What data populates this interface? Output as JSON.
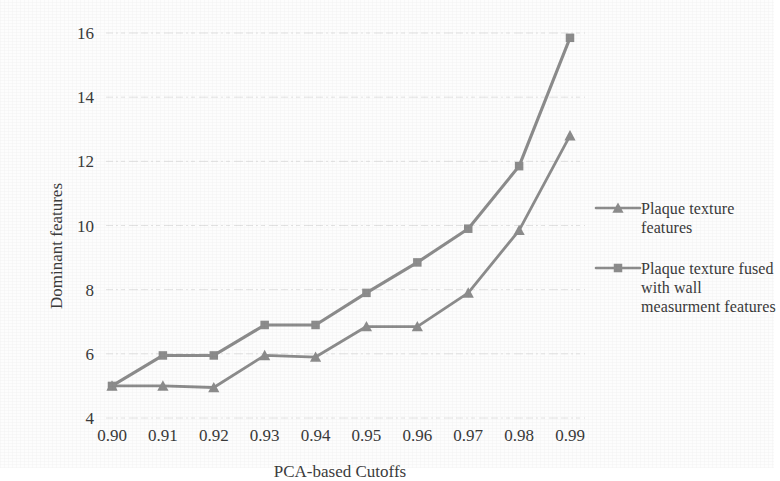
{
  "chart_data": {
    "type": "line",
    "title": "",
    "xlabel": "PCA-based Cutoffs",
    "ylabel": "Dominant features",
    "categories": [
      "0.90",
      "0.91",
      "0.92",
      "0.93",
      "0.94",
      "0.95",
      "0.96",
      "0.97",
      "0.98",
      "0.99"
    ],
    "x_tick_labels": [
      "0.90",
      "0.91",
      "0.92",
      "0.93",
      "0.94",
      "0.95",
      "0.96",
      "0.97",
      "0.98",
      "0.99"
    ],
    "y_tick_labels": [
      "4",
      "6",
      "8",
      "10",
      "12",
      "14",
      "16"
    ],
    "y_ticks": [
      4,
      6,
      8,
      10,
      12,
      14,
      16
    ],
    "ylim": [
      3.6,
      16.3
    ],
    "grid": "horizontal-dotted",
    "legend_position": "right",
    "series": [
      {
        "name": "Plaque texture features",
        "marker": "triangle",
        "color": "#8c8c8c",
        "values": [
          5.0,
          5.0,
          4.95,
          5.95,
          5.9,
          6.85,
          6.85,
          7.9,
          9.85,
          12.8
        ]
      },
      {
        "name": "Plaque texture fused with wall measurment features",
        "marker": "square",
        "color": "#8c8c8c",
        "values": [
          5.0,
          5.95,
          5.95,
          6.9,
          6.9,
          7.9,
          8.85,
          9.9,
          11.85,
          15.85
        ]
      }
    ]
  },
  "legend": {
    "entries": [
      {
        "label": "Plaque texture\nfeatures",
        "marker": "triangle-marker"
      },
      {
        "label": "Plaque texture fused\nwith wall\nmeasurment features",
        "marker": "square-marker"
      }
    ]
  },
  "axes": {
    "x_title": "PCA-based Cutoffs",
    "y_title": "Dominant features"
  },
  "colors": {
    "series_gray": "#8c8c8c",
    "grid_gray": "#e2e2e2",
    "text_gray": "#3a3a3a",
    "background": "#fdfdfd"
  }
}
